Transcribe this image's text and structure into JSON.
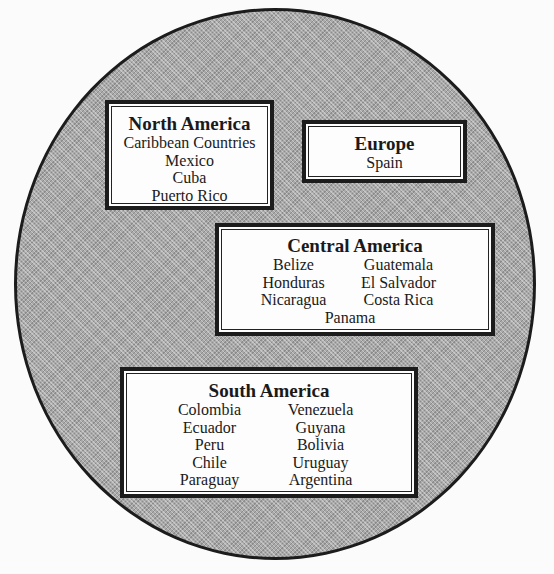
{
  "diagram": {
    "type": "region-grouping",
    "background_shape": "circle",
    "colors": {
      "circle_fill": "#a9a9a9",
      "circle_border": "#1c1c1c",
      "box_fill": "#fdfdfd",
      "box_border": "#1c1c1c",
      "text": "#1a1a1a"
    },
    "regions": [
      {
        "title": "North America",
        "items": [
          "Caribbean Countries",
          "Mexico",
          "Cuba",
          "Puerto Rico"
        ]
      },
      {
        "title": "Europe",
        "items": [
          "Spain"
        ]
      },
      {
        "title": "Central America",
        "items": [
          "Belize",
          "Guatemala",
          "Honduras",
          "El Salvador",
          "Nicaragua",
          "Costa Rica",
          "Panama"
        ]
      },
      {
        "title": "South America",
        "items": [
          "Colombia",
          "Venezuela",
          "Ecuador",
          "Guyana",
          "Peru",
          "Bolivia",
          "Chile",
          "Uruguay",
          "Paraguay",
          "Argentina"
        ]
      }
    ]
  }
}
